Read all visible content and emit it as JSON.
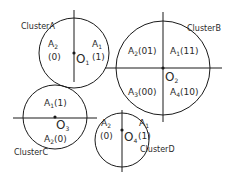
{
  "diagram": {
    "colors": {
      "stroke": "#1a1a1a",
      "text": "#2a2a2a",
      "background": "#ffffff"
    },
    "clusters": [
      {
        "name": "ClusterA",
        "center": {
          "label": "O",
          "sub": "1"
        },
        "regions": [
          {
            "label": "A",
            "sub": "2",
            "code": "(0)"
          },
          {
            "label": "A",
            "sub": "1",
            "code": "(1)"
          }
        ]
      },
      {
        "name": "ClusterB",
        "center": {
          "label": "O",
          "sub": "2"
        },
        "regions": [
          {
            "label": "A",
            "sub": "2",
            "code": "(01)"
          },
          {
            "label": "A",
            "sub": "1",
            "code": "(11)"
          },
          {
            "label": "A",
            "sub": "3",
            "code": "(00)"
          },
          {
            "label": "A",
            "sub": "4",
            "code": "(10)"
          }
        ]
      },
      {
        "name": "ClusterC",
        "center": {
          "label": "O",
          "sub": "3"
        },
        "regions": [
          {
            "label": "A",
            "sub": "1",
            "code": "(1)"
          },
          {
            "label": "A",
            "sub": "2",
            "code": "(0)"
          }
        ]
      },
      {
        "name": "ClusterD",
        "center": {
          "label": "O",
          "sub": "4"
        },
        "regions": [
          {
            "label": "A",
            "sub": "2",
            "code": "(0)"
          },
          {
            "label": "A",
            "sub": "1",
            "code": "(1)"
          }
        ]
      }
    ]
  }
}
